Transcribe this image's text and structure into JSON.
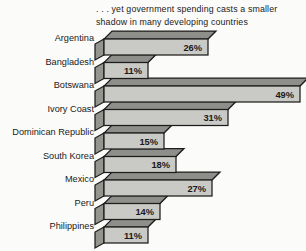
{
  "chart": {
    "title_lines": [
      ". . . yet government spending casts a smaller",
      "shadow in many developing countries"
    ]
  },
  "chart_data": {
    "type": "bar",
    "orientation": "horizontal",
    "style": "3d-oblique",
    "title": ". . . yet government spending casts a smaller shadow in many developing countries",
    "categories": [
      "Argentina",
      "Bangladesh",
      "Botswana",
      "Ivory Coast",
      "Dominican Republic",
      "South Korea",
      "Mexico",
      "Peru",
      "Philippines"
    ],
    "values": [
      26,
      11,
      49,
      31,
      15,
      18,
      27,
      14,
      11
    ],
    "value_labels": [
      "26%",
      "11%",
      "49%",
      "31%",
      "15%",
      "18%",
      "27%",
      "14%",
      "11%"
    ],
    "unit": "%",
    "xlim": [
      0,
      50
    ],
    "axis": "none",
    "grid": false,
    "legend": "none",
    "colors": {
      "bar_front": "#c9c9c6",
      "bar_top": "#8e8e8b",
      "bar_side": "#95958f",
      "outline": "#1c1c1c",
      "text": "#1a1a1a",
      "background": "#fbfbf9"
    }
  }
}
